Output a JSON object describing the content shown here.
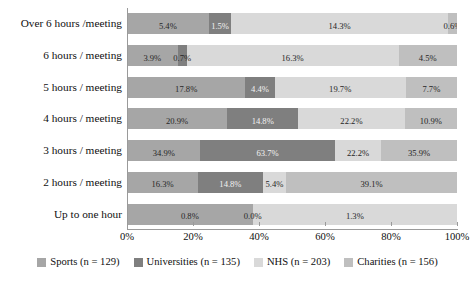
{
  "chart_data": {
    "type": "bar",
    "orientation": "horizontal",
    "stacked": true,
    "stack_mode": "100%",
    "title": "",
    "subtitle": "",
    "xlabel": "",
    "ylabel": "",
    "xlim": [
      0,
      100
    ],
    "grid": false,
    "legend_position": "bottom",
    "xtick_labels": [
      "0%",
      "20%",
      "40%",
      "60%",
      "80%",
      "100%"
    ],
    "xtick_values": [
      0,
      20,
      40,
      60,
      80,
      100
    ],
    "categories": [
      "Over 6 hours /meeting",
      "6 hours / meeting",
      "5 hours / meeting",
      "4 hours / meeting",
      "3 hours / meeting",
      "2 hours / meeting",
      "Up to one hour"
    ],
    "series": [
      {
        "name": "Sports (n = 129)",
        "color": "#a6a6a6",
        "values": [
          5.4,
          3.9,
          17.8,
          20.9,
          34.9,
          16.3,
          0.8
        ],
        "labels": [
          "5.4%",
          "3.9%",
          "17.8%",
          "20.9%",
          "34.9%",
          "16.3%",
          "0.8%"
        ]
      },
      {
        "name": "Universities (n = 135)",
        "color": "#7f7f7f",
        "values": [
          1.5,
          0.7,
          4.4,
          14.8,
          63.7,
          14.8,
          0.0
        ],
        "labels": [
          "1.5%",
          "0.7%",
          "4.4%",
          "14.8%",
          "63.7%",
          "14.8%",
          "0.0%"
        ]
      },
      {
        "name": "NHS (n = 203)",
        "color": "#d9d9d9",
        "values": [
          14.3,
          16.3,
          19.7,
          22.2,
          22.2,
          5.4,
          1.3
        ],
        "labels": [
          "14.3%",
          "16.3%",
          "19.7%",
          "22.2%",
          "22.2%",
          "5.4%",
          "1.3%"
        ]
      },
      {
        "name": "Charities (n = 156)",
        "color": "#bfbfbf",
        "values": [
          0.6,
          4.5,
          7.7,
          10.9,
          35.9,
          39.1,
          0.0
        ],
        "labels": [
          "0.6%",
          "4.5%",
          "7.7%",
          "10.9%",
          "35.9%",
          "39.1%",
          ""
        ]
      }
    ]
  }
}
